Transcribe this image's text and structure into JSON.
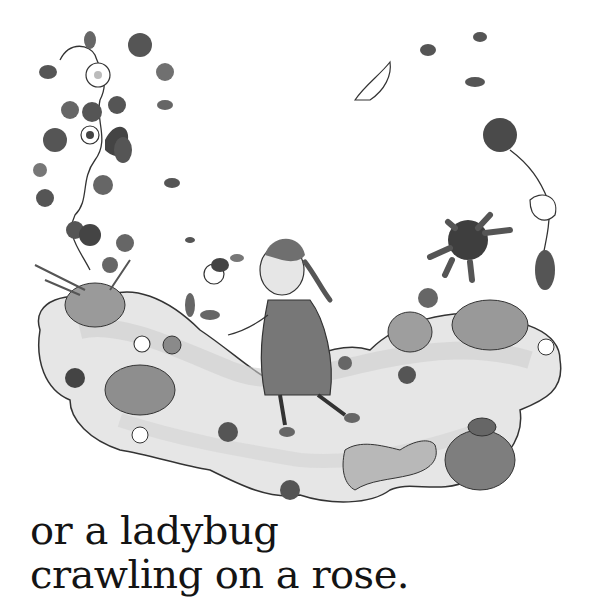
{
  "page": {
    "background": "#ffffff",
    "ink_color": "#141414"
  },
  "illustration": {
    "style": "grayscale watercolor",
    "scene": "girl with braid walking on a grassy cloud-shaped path surrounded by flowers, vines and small animals",
    "elements": [
      {
        "name": "girl",
        "label": "girl with braid in dress"
      },
      {
        "name": "flower-vine-left",
        "label": "flowering vine on left"
      },
      {
        "name": "flower-vine-right",
        "label": "flowering vine on right"
      },
      {
        "name": "sun-flower",
        "label": "dark spiky sun-like flower"
      },
      {
        "name": "ladybug",
        "label": "ladybug on flower"
      },
      {
        "name": "snail",
        "label": "snail"
      },
      {
        "name": "cat",
        "label": "spotted cat"
      },
      {
        "name": "turtle",
        "label": "turtle on rock"
      },
      {
        "name": "goat",
        "label": "white goat"
      },
      {
        "name": "flying-animals",
        "label": "small animals in the sky"
      },
      {
        "name": "rocks",
        "label": "round rocks"
      },
      {
        "name": "grass-path",
        "label": "grassy cloud-shaped path"
      }
    ]
  },
  "caption": {
    "line1": "or a ladybug",
    "line2": "crawling on a rose."
  }
}
